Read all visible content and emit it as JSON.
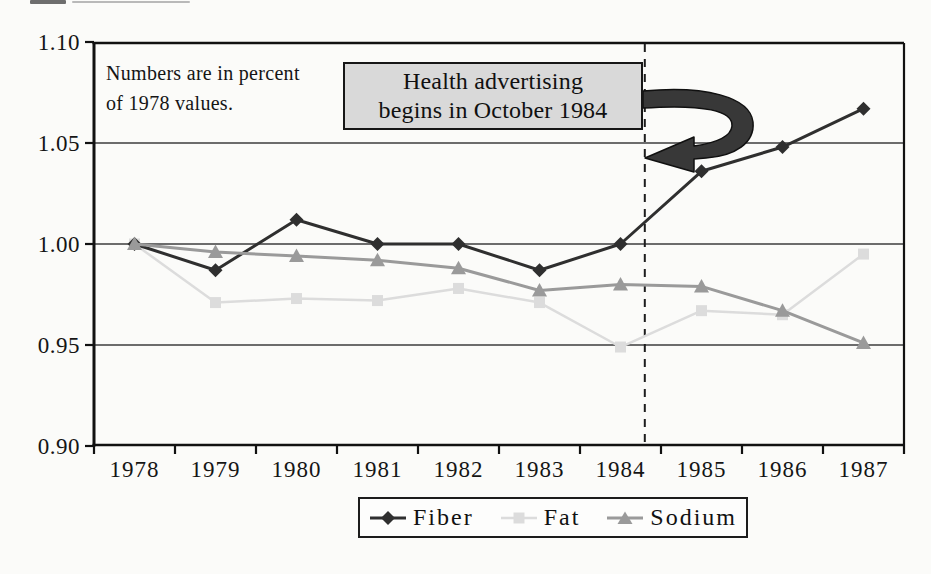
{
  "figure": {
    "note_line1": "Numbers are in percent",
    "note_line2": "of 1978 values.",
    "annotation_line1": "Health advertising",
    "annotation_line2": "begins in October 1984"
  },
  "colors": {
    "background": "#fbfbf9",
    "frame": "#111111",
    "grid": "#3d3d3d",
    "event_line": "#1d1d1d",
    "arrow": "#383838",
    "annotation_fill": "#d9d9d9",
    "fiber": "#2f2f2f",
    "fat": "#dcdcdc",
    "sodium": "#9a9a9a"
  },
  "chart_data": {
    "type": "line",
    "title": "",
    "xlabel": "",
    "ylabel": "",
    "x": [
      1978,
      1979,
      1980,
      1981,
      1982,
      1983,
      1984,
      1985,
      1986,
      1987
    ],
    "x_tick_labels": [
      "1978",
      "1979",
      "1980",
      "1981",
      "1982",
      "1983",
      "1984",
      "1985",
      "1986",
      "1987"
    ],
    "y_tick_labels": [
      "1.10",
      "1.05",
      "1.00",
      "0.95",
      "0.90"
    ],
    "y_tick_values": [
      1.1,
      1.05,
      1.0,
      0.95,
      0.9
    ],
    "ylim": [
      0.9,
      1.1
    ],
    "grid": "horizontal",
    "legend_position": "bottom",
    "note": "Numbers are in percent of 1978 values.",
    "annotation": "Health advertising begins in October 1984",
    "event_line_x": 1984.3,
    "series": [
      {
        "name": "Fat",
        "marker": "square",
        "color": "#dcdcdc",
        "line_width": 2.5,
        "values": [
          1.0,
          0.971,
          0.973,
          0.972,
          0.978,
          0.971,
          0.949,
          0.967,
          0.965,
          0.995
        ]
      },
      {
        "name": "Fiber",
        "marker": "diamond",
        "color": "#2f2f2f",
        "line_width": 3,
        "values": [
          1.0,
          0.987,
          1.012,
          1.0,
          1.0,
          0.987,
          1.0,
          1.036,
          1.048,
          1.067
        ]
      },
      {
        "name": "Sodium",
        "marker": "triangle",
        "color": "#9a9a9a",
        "line_width": 3,
        "values": [
          1.0,
          0.996,
          0.994,
          0.992,
          0.988,
          0.977,
          0.98,
          0.979,
          0.967,
          0.951
        ]
      }
    ],
    "legend_order": [
      "Fiber",
      "Fat",
      "Sodium"
    ]
  }
}
